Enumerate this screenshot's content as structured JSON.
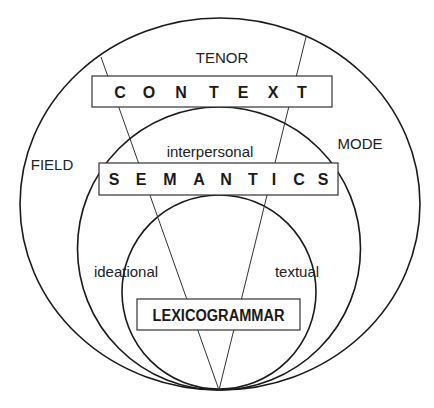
{
  "diagram": {
    "type": "nested-circles",
    "strata": {
      "context": {
        "label": "CONTEXT",
        "letters": [
          "C",
          "O",
          "N",
          "T",
          "E",
          "X",
          "T"
        ]
      },
      "semantics": {
        "label": "SEMANTICS",
        "letters": [
          "S",
          "E",
          "M",
          "A",
          "N",
          "T",
          "I",
          "C",
          "S"
        ]
      },
      "lexicogrammar": {
        "label": "LEXICOGRAMMAR"
      }
    },
    "register_variables": {
      "field": "FIELD",
      "tenor": "TENOR",
      "mode": "MODE"
    },
    "metafunctions": {
      "ideational": "ideational",
      "interpersonal": "interpersonal",
      "textual": "textual"
    },
    "colors": {
      "stroke": "#1a1a1a",
      "text": "#222222",
      "background": "#ffffff"
    }
  }
}
